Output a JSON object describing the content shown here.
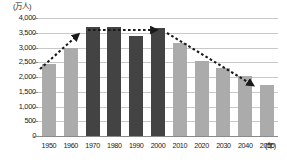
{
  "chart_data": {
    "type": "bar",
    "title": "",
    "subtitle": "",
    "xlabel": "(年)",
    "ylabel": "(万人)",
    "categories": [
      "1950",
      "1960",
      "1970",
      "1980",
      "1990",
      "2000",
      "2010",
      "2020",
      "2030",
      "2040",
      "2050"
    ],
    "values": [
      2450,
      3000,
      3700,
      3710,
      3380,
      3650,
      3150,
      2550,
      2300,
      2020,
      1720
    ],
    "bar_styles": [
      "light",
      "light",
      "dark",
      "dark",
      "dark",
      "dark",
      "light",
      "light",
      "light",
      "light",
      "light"
    ],
    "ylim": [
      0,
      4000
    ],
    "ytick_values": [
      0,
      500,
      1000,
      1500,
      2000,
      2500,
      3000,
      3500,
      4000
    ],
    "ytick_labels": [
      "0",
      "500",
      "1,000",
      "1,500",
      "2,000",
      "2,500",
      "3,000",
      "3,500",
      "4,000"
    ],
    "grid": true,
    "legend": null,
    "legend_position": "none",
    "annotations": [
      {
        "name": "rising-trend-arrow",
        "style": "dashed-arrow",
        "direction": "up",
        "from_x": 40,
        "from_y": 69,
        "to_x": 81,
        "to_y": 32
      },
      {
        "name": "plateau-trend-arrow",
        "style": "dashed-arrow",
        "direction": "right",
        "from_x": 88,
        "from_y": 30,
        "to_x": 160,
        "to_y": 30
      },
      {
        "name": "declining-trend-arrow",
        "style": "dashed-arrow",
        "direction": "down-right",
        "from_x": 167,
        "from_y": 33,
        "to_x": 256,
        "to_y": 87
      }
    ],
    "colors": {
      "bar_light": "#ababab",
      "bar_dark": "#434343",
      "grid": "#c8c8c8",
      "axis": "#8a8a8a",
      "annotation": "#1a1a1a",
      "background": "#ffffff"
    }
  }
}
